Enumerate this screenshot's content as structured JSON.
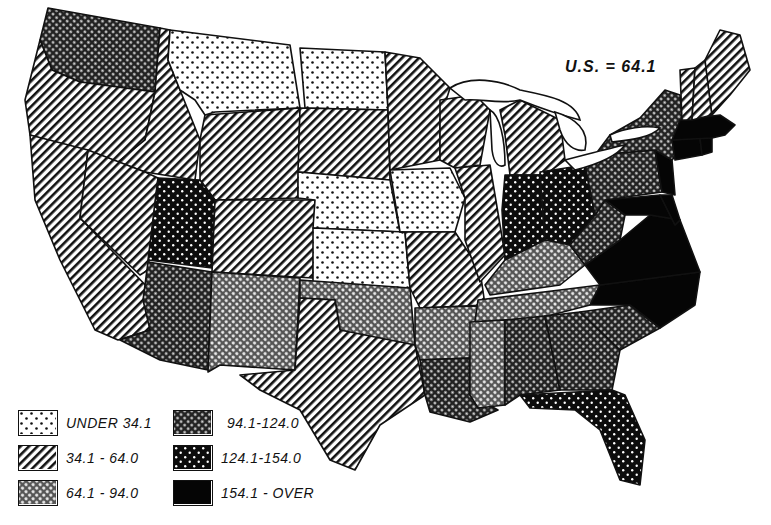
{
  "map": {
    "summary_label": "U.S. = 64.1",
    "legend": [
      {
        "id": "c1",
        "label": "UNDER 34.1",
        "pattern": "sparse-dots"
      },
      {
        "id": "c2",
        "label": "34.1 - 64.0",
        "pattern": "diagonal-lines"
      },
      {
        "id": "c3",
        "label": "64.1 - 94.0",
        "pattern": "light-crosshatch"
      },
      {
        "id": "c4",
        "label": "94.1-124.0",
        "pattern": "dark-crosshatch"
      },
      {
        "id": "c5",
        "label": "124.1-154.0",
        "pattern": "white-dots-on-black"
      },
      {
        "id": "c6",
        "label": "154.1 - OVER",
        "pattern": "solid-black"
      }
    ],
    "states": {
      "WA": "c4",
      "OR": "c2",
      "CA": "c2",
      "ID": "c2",
      "NV": "c2",
      "MT": "c1",
      "WY": "c2",
      "UT": "c5",
      "AZ": "c4",
      "CO": "c2",
      "NM": "c3",
      "ND": "c1",
      "SD": "c2",
      "NE": "c1",
      "KS": "c1",
      "OK": "c3",
      "TX": "c2",
      "MN": "c2",
      "IA": "c1",
      "MO": "c2",
      "AR": "c3",
      "LA": "c4",
      "WI": "c2",
      "IL": "c2",
      "MI": "c2",
      "IN": "c5",
      "OH": "c5",
      "KY": "c3",
      "TN": "c3",
      "MS": "c3",
      "AL": "c4",
      "GA": "c4",
      "FL": "c5",
      "SC": "c4",
      "NC": "c6",
      "VA": "c6",
      "WV": "c4",
      "PA": "c4",
      "NY": "c4",
      "ME": "c2",
      "VT": "c2",
      "NH": "c2",
      "MA": "c6",
      "CT": "c6",
      "RI": "c6",
      "NJ": "c6",
      "DE": "c6",
      "MD": "c6"
    }
  }
}
